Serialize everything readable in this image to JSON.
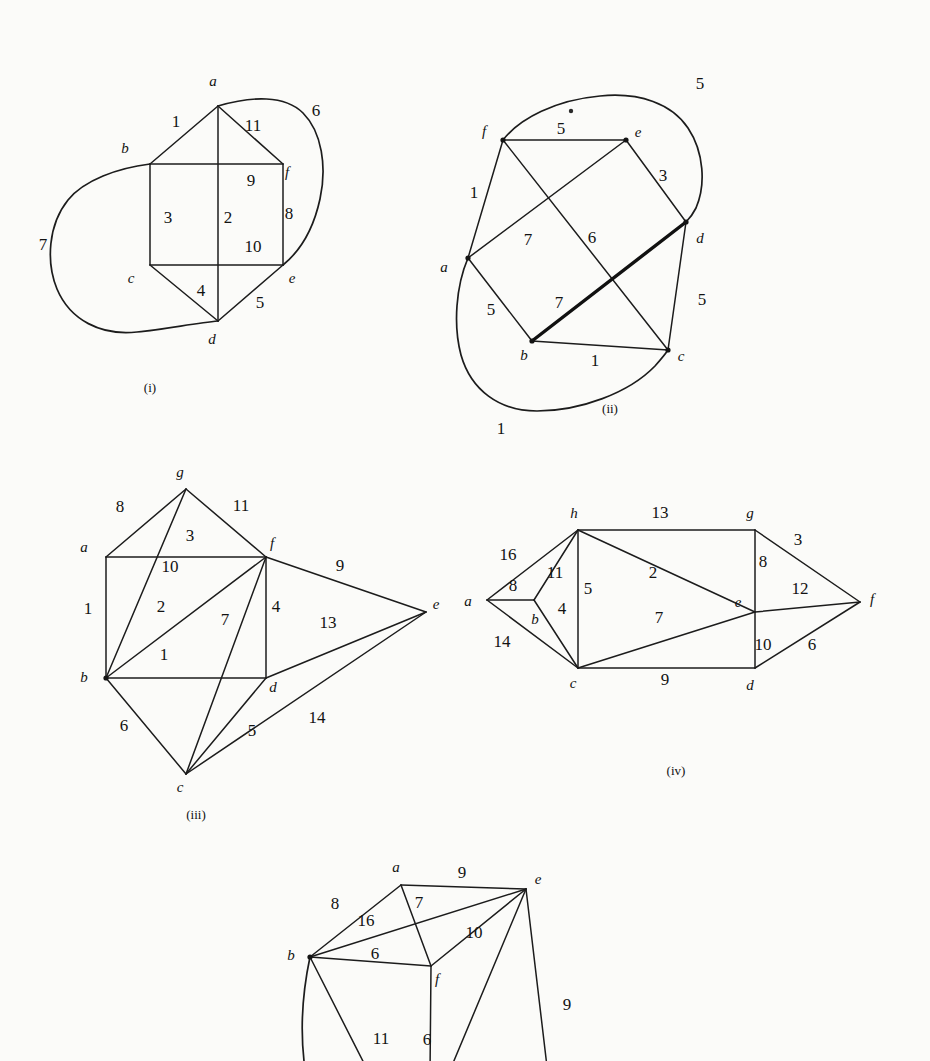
{
  "page": {
    "background": "#fbfbf9",
    "ink": "#1c1c1c",
    "width": 930,
    "height": 1061
  },
  "figures": [
    {
      "id": "i",
      "caption": "(i)",
      "caption_pos": [
        150,
        392
      ],
      "vertices": [
        {
          "name": "a",
          "x": 218,
          "y": 106,
          "lx": 213,
          "ly": 86,
          "dot": false
        },
        {
          "name": "b",
          "x": 150,
          "y": 164,
          "lx": 125,
          "ly": 153,
          "dot": false
        },
        {
          "name": "c",
          "x": 150,
          "y": 265,
          "lx": 131,
          "ly": 283,
          "dot": false
        },
        {
          "name": "d",
          "x": 218,
          "y": 321,
          "lx": 212,
          "ly": 344,
          "dot": false
        },
        {
          "name": "e",
          "x": 283,
          "y": 265,
          "lx": 292,
          "ly": 283,
          "dot": false
        },
        {
          "name": "f",
          "x": 283,
          "y": 164,
          "lx": 287,
          "ly": 177,
          "dot": false
        }
      ],
      "edges": [
        {
          "from": "b",
          "to": "a",
          "w": "1",
          "lx": 176,
          "ly": 127,
          "kind": "line"
        },
        {
          "from": "a",
          "to": "f",
          "w": "11",
          "lx": 253,
          "ly": 131,
          "kind": "line"
        },
        {
          "from": "a",
          "to": "d",
          "w": "2",
          "lx": 228,
          "ly": 223,
          "kind": "line"
        },
        {
          "from": "b",
          "to": "f",
          "w": "9",
          "lx": 251,
          "ly": 186,
          "kind": "line"
        },
        {
          "from": "b",
          "to": "c",
          "w": "3",
          "lx": 168,
          "ly": 223,
          "kind": "line"
        },
        {
          "from": "c",
          "to": "e",
          "w": "10",
          "lx": 253,
          "ly": 252,
          "kind": "line"
        },
        {
          "from": "f",
          "to": "e",
          "w": "8",
          "lx": 289,
          "ly": 219,
          "kind": "line"
        },
        {
          "from": "c",
          "to": "d",
          "w": "4",
          "lx": 201,
          "ly": 296,
          "kind": "line"
        },
        {
          "from": "d",
          "to": "e",
          "w": "5",
          "lx": 260,
          "ly": 308,
          "kind": "line"
        },
        {
          "from": "a",
          "to": "e",
          "w": "6",
          "lx": 316,
          "ly": 116,
          "kind": "curve",
          "path": "M 218 106 C 252 96 285 95 303 113 C 322 132 327 167 320 199 C 313 231 299 252 283 265"
        },
        {
          "from": "b",
          "to": "d",
          "w": "7",
          "lx": 43,
          "ly": 250,
          "kind": "curve",
          "path": "M 150 164 C 118 168 84 180 68 200 C 48 225 46 262 57 289 C 70 320 101 336 137 332 C 166 329 196 323 218 321"
        }
      ]
    },
    {
      "id": "ii",
      "caption": "(ii)",
      "caption_pos": [
        610,
        413
      ],
      "vertices": [
        {
          "name": "f",
          "x": 503,
          "y": 140,
          "lx": 484,
          "ly": 136,
          "dot": true
        },
        {
          "name": "e",
          "x": 626,
          "y": 140,
          "lx": 638,
          "ly": 137,
          "dot": true
        },
        {
          "name": "a",
          "x": 468,
          "y": 258,
          "lx": 444,
          "ly": 272,
          "dot": true
        },
        {
          "name": "d",
          "x": 686,
          "y": 222,
          "lx": 700,
          "ly": 243,
          "dot": true
        },
        {
          "name": "b",
          "x": 532,
          "y": 341,
          "lx": 524,
          "ly": 360,
          "dot": true
        },
        {
          "name": "c",
          "x": 668,
          "y": 350,
          "lx": 681,
          "ly": 361,
          "dot": true
        }
      ],
      "edges": [
        {
          "from": "f",
          "to": "e",
          "w": "5",
          "lx": 561,
          "ly": 134,
          "kind": "line"
        },
        {
          "from": "f",
          "to": "a",
          "w": "1",
          "lx": 474,
          "ly": 198,
          "kind": "line"
        },
        {
          "from": "a",
          "to": "b",
          "w": "5",
          "lx": 491,
          "ly": 315,
          "kind": "line"
        },
        {
          "from": "b",
          "to": "c",
          "w": "1",
          "lx": 595,
          "ly": 366,
          "kind": "line"
        },
        {
          "from": "c",
          "to": "d",
          "w": "5",
          "lx": 702,
          "ly": 305,
          "kind": "line"
        },
        {
          "from": "d",
          "to": "e",
          "w": "3",
          "lx": 663,
          "ly": 181,
          "kind": "line"
        },
        {
          "from": "a",
          "to": "e",
          "w": "7",
          "lx": 528,
          "ly": 245,
          "kind": "line"
        },
        {
          "from": "f",
          "to": "c",
          "w": "6",
          "lx": 592,
          "ly": 243,
          "kind": "line"
        },
        {
          "from": "b",
          "to": "d",
          "w": "7",
          "lx": 559,
          "ly": 308,
          "kind": "thick"
        },
        {
          "from": "f",
          "to": "d",
          "w": "5",
          "lx": 700,
          "ly": 89,
          "kind": "curve",
          "path": "M 503 140 C 520 118 556 100 600 96 C 640 92 672 104 688 128 C 704 152 706 185 696 208 C 692 216 689 219 686 222"
        },
        {
          "from": "a",
          "to": "c",
          "w": "1",
          "lx": 501,
          "ly": 434,
          "kind": "curve",
          "path": "M 468 258 C 456 286 453 325 461 355 C 471 390 499 411 537 411 C 580 411 629 393 655 366 C 663 357 666 353 668 350"
        }
      ],
      "speck": {
        "x": 571,
        "y": 111,
        "r": 2.2
      }
    },
    {
      "id": "iii",
      "caption": "(iii)",
      "caption_pos": [
        196,
        819
      ],
      "vertices": [
        {
          "name": "g",
          "x": 186,
          "y": 489,
          "lx": 180,
          "ly": 477,
          "dot": false
        },
        {
          "name": "a",
          "x": 106,
          "y": 557,
          "lx": 84,
          "ly": 552,
          "dot": false
        },
        {
          "name": "f",
          "x": 266,
          "y": 557,
          "lx": 272,
          "ly": 548,
          "dot": false
        },
        {
          "name": "b",
          "x": 106,
          "y": 678,
          "lx": 84,
          "ly": 682,
          "dot": true
        },
        {
          "name": "d",
          "x": 266,
          "y": 678,
          "lx": 273,
          "ly": 692,
          "dot": false
        },
        {
          "name": "c",
          "x": 186,
          "y": 774,
          "lx": 180,
          "ly": 792,
          "dot": false
        },
        {
          "name": "e",
          "x": 426,
          "y": 612,
          "lx": 436,
          "ly": 609,
          "dot": false
        }
      ],
      "edges": [
        {
          "from": "a",
          "to": "g",
          "w": "8",
          "lx": 120,
          "ly": 512,
          "kind": "line"
        },
        {
          "from": "g",
          "to": "f",
          "w": "11",
          "lx": 241,
          "ly": 511,
          "kind": "line"
        },
        {
          "from": "g",
          "to": "b",
          "w": "10",
          "lx": 170,
          "ly": 572,
          "kind": "line"
        },
        {
          "from": "a",
          "to": "f",
          "w": "3",
          "lx": 190,
          "ly": 541,
          "kind": "line"
        },
        {
          "from": "a",
          "to": "b",
          "w": "1",
          "lx": 88,
          "ly": 614,
          "kind": "line"
        },
        {
          "from": "b",
          "to": "f",
          "w": "2",
          "lx": 161,
          "ly": 612,
          "kind": "line"
        },
        {
          "from": "b",
          "to": "d",
          "w": "1",
          "lx": 164,
          "ly": 660,
          "kind": "line"
        },
        {
          "from": "f",
          "to": "d",
          "w": "4",
          "lx": 276,
          "ly": 612,
          "kind": "line"
        },
        {
          "from": "f",
          "to": "c",
          "w": "7",
          "lx": 225,
          "ly": 625,
          "kind": "line"
        },
        {
          "from": "f",
          "to": "e",
          "w": "9",
          "lx": 340,
          "ly": 571,
          "kind": "line"
        },
        {
          "from": "d",
          "to": "e",
          "w": "13",
          "lx": 328,
          "ly": 628,
          "kind": "line"
        },
        {
          "from": "b",
          "to": "c",
          "w": "6",
          "lx": 124,
          "ly": 731,
          "kind": "line"
        },
        {
          "from": "c",
          "to": "d",
          "w": "5",
          "lx": 252,
          "ly": 736,
          "kind": "line"
        },
        {
          "from": "c",
          "to": "e",
          "w": "14",
          "lx": 317,
          "ly": 723,
          "kind": "line"
        }
      ]
    },
    {
      "id": "iv",
      "caption": "(iv)",
      "caption_pos": [
        676,
        775
      ],
      "vertices": [
        {
          "name": "a",
          "x": 487,
          "y": 600,
          "lx": 468,
          "ly": 606,
          "dot": false
        },
        {
          "name": "b",
          "x": 534,
          "y": 600,
          "lx": 535,
          "ly": 624,
          "dot": false
        },
        {
          "name": "h",
          "x": 578,
          "y": 530,
          "lx": 574,
          "ly": 518,
          "dot": false
        },
        {
          "name": "c",
          "x": 578,
          "y": 668,
          "lx": 573,
          "ly": 688,
          "dot": false
        },
        {
          "name": "g",
          "x": 755,
          "y": 530,
          "lx": 750,
          "ly": 518,
          "dot": false
        },
        {
          "name": "e",
          "x": 755,
          "y": 612,
          "lx": 738,
          "ly": 607,
          "dot": false
        },
        {
          "name": "d",
          "x": 755,
          "y": 668,
          "lx": 750,
          "ly": 690,
          "dot": false
        },
        {
          "name": "f",
          "x": 860,
          "y": 602,
          "lx": 872,
          "ly": 604,
          "dot": false
        }
      ],
      "edges": [
        {
          "from": "a",
          "to": "h",
          "w": "16",
          "lx": 508,
          "ly": 560,
          "kind": "line"
        },
        {
          "from": "a",
          "to": "b",
          "w": "8",
          "lx": 513,
          "ly": 591,
          "kind": "line"
        },
        {
          "from": "a",
          "to": "c",
          "w": "14",
          "lx": 502,
          "ly": 647,
          "kind": "line"
        },
        {
          "from": "b",
          "to": "h",
          "w": "11",
          "lx": 555,
          "ly": 578,
          "kind": "line"
        },
        {
          "from": "b",
          "to": "c",
          "w": "4",
          "lx": 562,
          "ly": 614,
          "kind": "line"
        },
        {
          "from": "h",
          "to": "c",
          "w": "5",
          "lx": 588,
          "ly": 594,
          "kind": "line"
        },
        {
          "from": "h",
          "to": "g",
          "w": "13",
          "lx": 660,
          "ly": 518,
          "kind": "line"
        },
        {
          "from": "h",
          "to": "e",
          "w": "2",
          "lx": 653,
          "ly": 578,
          "kind": "line"
        },
        {
          "from": "c",
          "to": "e",
          "w": "7",
          "lx": 659,
          "ly": 623,
          "kind": "line"
        },
        {
          "from": "c",
          "to": "d",
          "w": "9",
          "lx": 665,
          "ly": 685,
          "kind": "line"
        },
        {
          "from": "g",
          "to": "e",
          "w": "8",
          "lx": 763,
          "ly": 567,
          "kind": "line"
        },
        {
          "from": "g",
          "to": "f",
          "w": "3",
          "lx": 798,
          "ly": 545,
          "kind": "line"
        },
        {
          "from": "e",
          "to": "f",
          "w": "12",
          "lx": 800,
          "ly": 594,
          "kind": "line"
        },
        {
          "from": "e",
          "to": "d",
          "w": "10",
          "lx": 763,
          "ly": 650,
          "kind": "line"
        },
        {
          "from": "d",
          "to": "f",
          "w": "6",
          "lx": 812,
          "ly": 650,
          "kind": "line"
        }
      ]
    },
    {
      "id": "v",
      "caption": "",
      "caption_pos": [
        0,
        0
      ],
      "vertices": [
        {
          "name": "a",
          "x": 401,
          "y": 885,
          "lx": 396,
          "ly": 872,
          "dot": false
        },
        {
          "name": "e",
          "x": 526,
          "y": 889,
          "lx": 538,
          "ly": 884,
          "dot": false
        },
        {
          "name": "b",
          "x": 310,
          "y": 957,
          "lx": 291,
          "ly": 960,
          "dot": true
        },
        {
          "name": "f",
          "x": 431,
          "y": 966,
          "lx": 437,
          "ly": 984,
          "dot": false
        }
      ],
      "edges": [
        {
          "from": "b",
          "to": "a",
          "w": "8",
          "lx": 335,
          "ly": 909,
          "kind": "line"
        },
        {
          "from": "a",
          "to": "e",
          "w": "9",
          "lx": 462,
          "ly": 878,
          "kind": "line"
        },
        {
          "from": "b",
          "to": "e",
          "w": "16",
          "lx": 366,
          "ly": 926,
          "kind": "line"
        },
        {
          "from": "a",
          "to": "f",
          "w": "7",
          "lx": 419,
          "ly": 908,
          "kind": "line"
        },
        {
          "from": "f",
          "to": "e",
          "w": "10",
          "lx": 474,
          "ly": 938,
          "kind": "line"
        },
        {
          "from": "b",
          "to": "f",
          "w": "6",
          "lx": 375,
          "ly": 959,
          "kind": "line"
        },
        {
          "from": "b",
          "to": "x1",
          "w": "11",
          "lx": 381,
          "ly": 1044,
          "kind": "line"
        },
        {
          "from": "f",
          "to": "x2",
          "w": "6",
          "lx": 427,
          "ly": 1045,
          "kind": "line"
        },
        {
          "from": "e",
          "to": "x3",
          "w": "9",
          "lx": 567,
          "ly": 1010,
          "kind": "line"
        },
        {
          "from": "e",
          "to": "x4",
          "w": "",
          "lx": 0,
          "ly": 0,
          "kind": "line"
        },
        {
          "from": "b",
          "to": "x5",
          "w": "",
          "lx": 0,
          "ly": 0,
          "kind": "curve",
          "path": "M 310 957 C 303 990 300 1025 304 1061"
        }
      ],
      "offscreen": [
        {
          "name": "x1",
          "x": 370,
          "y": 1075
        },
        {
          "name": "x2",
          "x": 430,
          "y": 1075
        },
        {
          "name": "x3",
          "x": 548,
          "y": 1075
        },
        {
          "name": "x4",
          "x": 448,
          "y": 1075
        },
        {
          "name": "x5",
          "x": 304,
          "y": 1075
        }
      ]
    }
  ]
}
